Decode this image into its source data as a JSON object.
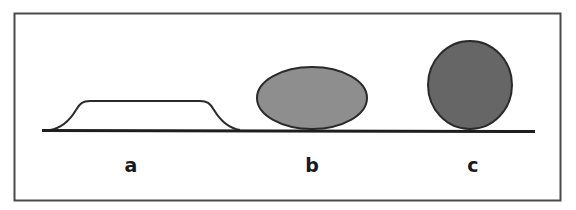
{
  "figure": {
    "labels": {
      "a": "a",
      "b": "b",
      "c": "c"
    },
    "colors": {
      "frame": "#4a4a4a",
      "baseline": "#1e1e1e",
      "outline": "#2a2a2a",
      "shape_a_fill": "#ffffff",
      "shape_b_fill": "#8e8e8e",
      "shape_c_fill": "#666666"
    }
  }
}
